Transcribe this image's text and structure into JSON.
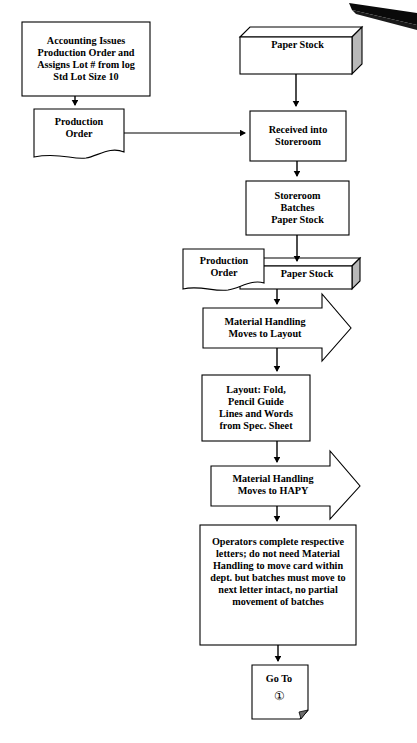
{
  "document": {
    "title": "Production Process Flowchart",
    "background_color": "#ffffff",
    "line_color": "#000000",
    "shade_color": "#b3b3b3",
    "artifact": {
      "name": "scan-artifact-black-wedge",
      "color": "#000000",
      "description": "black diagonal wedge mark at top right corner"
    }
  },
  "nodes": {
    "accounting": {
      "id": "accounting",
      "shape": "process-box",
      "label": "Accounting Issues\nProduction Order and\nAssigns Lot # from log\nStd Lot Size 10"
    },
    "production_order_1": {
      "id": "production_order_1",
      "shape": "document",
      "label": "Production\nOrder"
    },
    "paper_stock_1": {
      "id": "paper_stock_1",
      "shape": "three-d-box",
      "label": "Paper Stock"
    },
    "received": {
      "id": "received",
      "shape": "process-box",
      "label": "Received into\nStoreroom"
    },
    "storeroom_batches": {
      "id": "storeroom_batches",
      "shape": "process-box",
      "label": "Storeroom\nBatches\nPaper Stock"
    },
    "production_order_2": {
      "id": "production_order_2",
      "shape": "document",
      "label": "Production\nOrder"
    },
    "paper_stock_2": {
      "id": "paper_stock_2",
      "shape": "three-d-box",
      "label": "Paper Stock"
    },
    "material_handling_1": {
      "id": "material_handling_1",
      "shape": "right-arrow-block",
      "label": "Material Handling\nMoves to Layout"
    },
    "layout": {
      "id": "layout",
      "shape": "process-box",
      "label": "Layout: Fold,\nPencil Guide\nLines and Words\nfrom Spec. Sheet"
    },
    "material_handling_2": {
      "id": "material_handling_2",
      "shape": "right-arrow-block",
      "label": "Material Handling\nMoves to HAPY"
    },
    "operators": {
      "id": "operators",
      "shape": "process-box",
      "label": "Operators complete respective\nletters; do not need Material\nHandling to move card within\ndept. but batches must move to\nnext letter intact, no partial\nmovement of batches"
    },
    "go_to": {
      "id": "go_to",
      "shape": "folded-corner-note",
      "label": "Go To",
      "reference": "①"
    }
  },
  "connectors": [
    {
      "name": "accounting-to-production-order",
      "from": "accounting",
      "to": "production_order_1",
      "direction": "down",
      "arrowhead": true
    },
    {
      "name": "production-order-to-received",
      "from": "production_order_1",
      "to": "received",
      "direction": "right",
      "arrowhead": true
    },
    {
      "name": "paper-stock-to-received",
      "from": "paper_stock_1",
      "to": "received",
      "direction": "down",
      "arrowhead": true
    },
    {
      "name": "received-to-storeroom-batches",
      "from": "received",
      "to": "storeroom_batches",
      "direction": "down",
      "arrowhead": true
    },
    {
      "name": "storeroom-batches-to-paper-stock",
      "from": "storeroom_batches",
      "to": "paper_stock_2",
      "direction": "down",
      "arrowhead": true
    },
    {
      "name": "paper-stock-to-material-handling",
      "from": "paper_stock_2",
      "to": "material_handling_1",
      "direction": "down",
      "arrowhead": true
    },
    {
      "name": "material-handling-to-layout",
      "from": "material_handling_1",
      "to": "layout",
      "direction": "down",
      "arrowhead": true
    },
    {
      "name": "layout-to-material-handling-2",
      "from": "layout",
      "to": "material_handling_2",
      "direction": "down",
      "arrowhead": true
    },
    {
      "name": "material-handling-2-to-operators",
      "from": "material_handling_2",
      "to": "operators",
      "direction": "down",
      "arrowhead": true
    },
    {
      "name": "operators-to-go-to",
      "from": "operators",
      "to": "go_to",
      "direction": "down",
      "arrowhead": true
    }
  ]
}
